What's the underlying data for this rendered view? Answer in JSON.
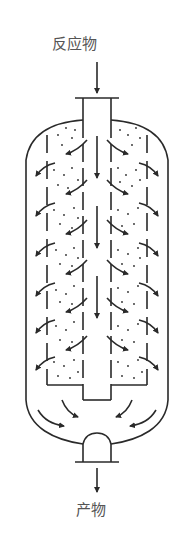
{
  "diagram": {
    "type": "radial-flow reactor schematic",
    "inlet_label": "反应物",
    "outlet_label": "产物",
    "colors": {
      "line": "#2a2a2a",
      "text": "#555555",
      "background": "#ffffff"
    },
    "components": [
      {
        "id": "inlet-pipe",
        "label": "reactant inlet"
      },
      {
        "id": "vessel-shell",
        "label": "reactor vessel"
      },
      {
        "id": "center-pipe",
        "label": "central distribution pipe"
      },
      {
        "id": "catalyst-bed-left",
        "label": "annular catalyst bed (left)"
      },
      {
        "id": "catalyst-bed-right",
        "label": "annular catalyst bed (right)"
      },
      {
        "id": "outlet-pipe",
        "label": "product outlet"
      }
    ],
    "flow": "reactant enters top, flows down central pipe, radially outward through catalyst bed, down the annulus, exits bottom"
  }
}
